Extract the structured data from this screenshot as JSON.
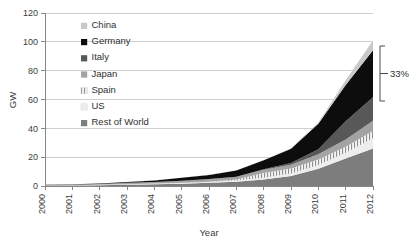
{
  "chart_data": {
    "type": "area",
    "stacked": true,
    "title": "",
    "xlabel": "Year",
    "ylabel": "GW",
    "x": [
      2000,
      2001,
      2002,
      2003,
      2004,
      2005,
      2006,
      2007,
      2008,
      2009,
      2010,
      2011,
      2012
    ],
    "categories": [
      "2000",
      "2001",
      "2002",
      "2003",
      "2004",
      "2005",
      "2006",
      "2007",
      "2008",
      "2009",
      "2010",
      "2011",
      "2012"
    ],
    "xlim": [
      2000,
      2012
    ],
    "ylim": [
      0,
      120
    ],
    "yticks": [
      0,
      20,
      40,
      60,
      80,
      100,
      120
    ],
    "xticks": [
      "2000",
      "2001",
      "2002",
      "2003",
      "2004",
      "2005",
      "2006",
      "2007",
      "2008",
      "2009",
      "2010",
      "2011",
      "2012"
    ],
    "grid": true,
    "legend_position": "upper-left-inside",
    "stack_order_bottom_to_top": [
      "Rest of World",
      "US",
      "Spain",
      "Japan",
      "Italy",
      "Germany",
      "China"
    ],
    "series": [
      {
        "name": "Rest of World",
        "color": "#7d7d7d",
        "pattern": "solid",
        "values": [
          0.3,
          0.4,
          0.6,
          0.9,
          1.2,
          1.6,
          2.2,
          3.0,
          4.5,
          7.0,
          12.0,
          19.0,
          26.0
        ]
      },
      {
        "name": "US",
        "color": "#ededed",
        "pattern": "solid",
        "values": [
          0.1,
          0.2,
          0.2,
          0.3,
          0.4,
          0.5,
          0.6,
          0.8,
          1.2,
          1.6,
          2.5,
          4.0,
          7.2
        ]
      },
      {
        "name": "Spain",
        "color": "#f2f2f2",
        "pattern": "vertical-hatch",
        "values": [
          0.0,
          0.0,
          0.0,
          0.1,
          0.1,
          0.1,
          0.2,
          0.7,
          3.4,
          3.5,
          3.9,
          4.3,
          5.0
        ]
      },
      {
        "name": "Japan",
        "color": "#a3a3a3",
        "pattern": "solid",
        "values": [
          0.3,
          0.5,
          0.6,
          0.9,
          1.1,
          1.4,
          1.7,
          1.9,
          2.1,
          2.6,
          3.6,
          4.9,
          7.0
        ]
      },
      {
        "name": "Italy",
        "color": "#585858",
        "pattern": "solid",
        "values": [
          0.0,
          0.0,
          0.0,
          0.0,
          0.0,
          0.0,
          0.1,
          0.1,
          0.5,
          1.2,
          3.5,
          12.8,
          16.4
        ]
      },
      {
        "name": "Germany",
        "color": "#0d0d0d",
        "pattern": "solid",
        "values": [
          0.1,
          0.2,
          0.3,
          0.5,
          1.1,
          2.1,
          2.9,
          4.2,
          6.1,
          9.9,
          17.6,
          25.0,
          32.6
        ]
      },
      {
        "name": "China",
        "color": "#c9c9c9",
        "pattern": "solid",
        "values": [
          0.0,
          0.0,
          0.0,
          0.1,
          0.1,
          0.1,
          0.1,
          0.1,
          0.2,
          0.3,
          0.9,
          3.3,
          6.8
        ]
      }
    ],
    "totals": [
      0.8,
      1.3,
      1.7,
      2.8,
      4.0,
      5.8,
      7.8,
      10.8,
      18.0,
      26.1,
      44.0,
      73.3,
      101.0
    ],
    "annotations": [
      {
        "text": "33%",
        "type": "bracket",
        "refers_to": "Germany",
        "y_from": 52,
        "y_to": 88
      }
    ]
  },
  "axes": {
    "y_label": "GW",
    "x_label": "Year",
    "y_ticks": [
      "0",
      "20",
      "40",
      "60",
      "80",
      "100",
      "120"
    ],
    "x_ticks": [
      "2000",
      "2001",
      "2002",
      "2003",
      "2004",
      "2005",
      "2006",
      "2007",
      "2008",
      "2009",
      "2010",
      "2011",
      "2012"
    ]
  },
  "legend": {
    "items": [
      {
        "label": "China",
        "color": "#c9c9c9",
        "pattern": "solid"
      },
      {
        "label": "Germany",
        "color": "#0d0d0d",
        "pattern": "solid"
      },
      {
        "label": "Italy",
        "color": "#585858",
        "pattern": "solid"
      },
      {
        "label": "Japan",
        "color": "#a3a3a3",
        "pattern": "solid"
      },
      {
        "label": "Spain",
        "color": "#f2f2f2",
        "pattern": "vertical-hatch"
      },
      {
        "label": "US",
        "color": "#ededed",
        "pattern": "solid"
      },
      {
        "label": "Rest of World",
        "color": "#7d7d7d",
        "pattern": "solid"
      }
    ]
  },
  "annotation": {
    "bracket_label": "33%"
  }
}
